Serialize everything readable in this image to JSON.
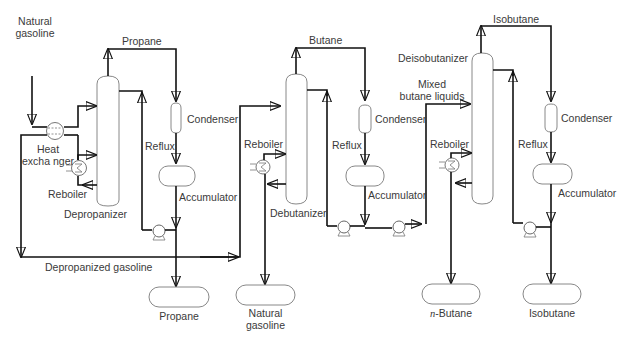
{
  "diagram": {
    "type": "process-flow",
    "labels": {
      "natural_gasoline_in": [
        "Natural",
        "gasoline"
      ],
      "propane_overhead": "Propane",
      "heat_exchanger": [
        "Heat",
        "excha nger"
      ],
      "reboiler_1": "Reboiler",
      "depropanizer": "Depropanizer",
      "condenser_1": "Condenser",
      "reflux_1": "Reflux",
      "accumulator_1": "Accumulator",
      "depropanized_gasoline": "Depropanized gasoline",
      "propane_product": "Propane",
      "butane_overhead": "Butane",
      "reboiler_2": "Reboiler",
      "debutanizer": "Debutanizer",
      "condenser_2": "Condenser",
      "reflux_2": "Reflux",
      "accumulator_2": "Accumulator",
      "natural_gasoline_product": [
        "Natural",
        "gasoline"
      ],
      "isobutane_overhead": "Isobutane",
      "deisobutanizer": "Deisobutanizer",
      "mixed_butane_liquids": [
        "Mixed",
        "butane liquids"
      ],
      "reboiler_3": "Reboiler",
      "condenser_3": "Condenser",
      "reflux_3": "Reflux",
      "accumulator_3": "Accumulator",
      "n_butane_prefix": "n",
      "n_butane_suffix": "-Butane",
      "isobutane_product": "Isobutane"
    },
    "units": [
      "Depropanizer",
      "Debutanizer",
      "Deisobutanizer"
    ],
    "products": [
      "Propane",
      "Natural gasoline",
      "n-Butane",
      "Isobutane"
    ],
    "line_color": "#111111",
    "vessel_color": "#888888",
    "text_color": "#3a3a3a"
  }
}
